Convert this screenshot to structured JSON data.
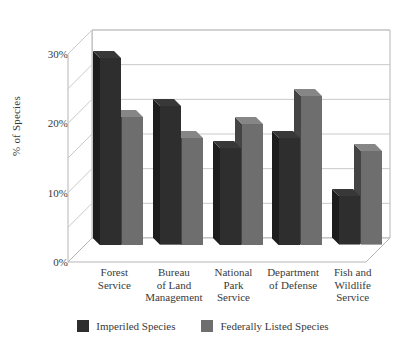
{
  "chart_data": {
    "type": "bar",
    "title": "",
    "xlabel": "",
    "ylabel": "% of Species",
    "ylim": [
      0,
      30
    ],
    "ytick_labels": [
      "0%",
      "10%",
      "20%",
      "30%"
    ],
    "ytick_values": [
      0,
      10,
      20,
      30
    ],
    "gridline_values": [
      5,
      10,
      15,
      20,
      25,
      30
    ],
    "grid": true,
    "legend_position": "bottom",
    "style": "3d-clustered-column",
    "categories": [
      "Forest Service",
      "Bureau of Land Management",
      "National Park Service",
      "Department of Defense",
      "Fish and Wildlife Service"
    ],
    "category_label_lines": [
      [
        "Forest",
        "Service"
      ],
      [
        "Bureau",
        "of Land",
        "Management"
      ],
      [
        "National",
        "Park",
        "Service"
      ],
      [
        "Department",
        "of Defense"
      ],
      [
        "Fish and",
        "Wildlife",
        "Service"
      ]
    ],
    "series": [
      {
        "name": "Imperiled Species",
        "color": "#2e2e2e",
        "values": [
          27.0,
          20.0,
          14.0,
          15.5,
          7.0
        ]
      },
      {
        "name": "Federally Listed Species",
        "color": "#6e6e6e",
        "values": [
          18.5,
          15.5,
          17.5,
          21.5,
          13.5
        ]
      }
    ]
  },
  "axis": {
    "y_title": "% of Species",
    "ticks": [
      {
        "label": "30%",
        "value": 30
      },
      {
        "label": "20%",
        "value": 20
      },
      {
        "label": "10%",
        "value": 10
      },
      {
        "label": "0%",
        "value": 0
      }
    ]
  },
  "legend": {
    "items": [
      {
        "label": "Imperiled Species",
        "color": "#2e2e2e"
      },
      {
        "label": "Federally Listed Species",
        "color": "#6e6e6e"
      }
    ]
  },
  "colors": {
    "series_dark": "#2e2e2e",
    "series_gray": "#6e6e6e",
    "gridline": "#c9c9c9",
    "axis_line": "#b5b5b5",
    "text": "#3a3a3a",
    "background": "#ffffff"
  }
}
